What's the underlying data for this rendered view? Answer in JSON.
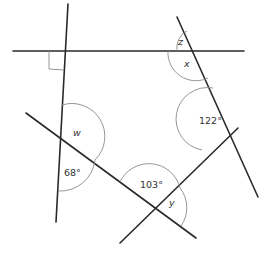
{
  "diagram": {
    "type": "angles-intersecting-lines",
    "colors": {
      "line": "#2a2a2a",
      "arc": "#8a8a8a",
      "label": "#333333",
      "background": "#ffffff"
    },
    "labels": {
      "z": "z",
      "x": "x",
      "w": "w",
      "y": "y",
      "angle_122": "122°",
      "angle_68": "68°",
      "angle_103": "103°"
    },
    "right_angle_marker": true
  }
}
